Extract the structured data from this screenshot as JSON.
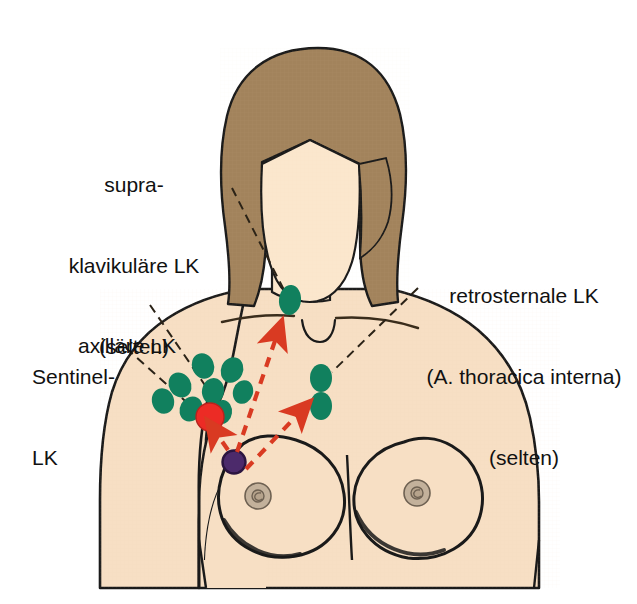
{
  "figure": {
    "background_color": "#ffffff"
  },
  "palette": {
    "skin": "#f7dfc4",
    "skin_face": "#fbe7cd",
    "hair": "#a2835c",
    "outline": "#1a1a1a",
    "lymph_node_green": "#11805e",
    "sentinel_node_red": "#ec2b25",
    "tumor_purple": "#4c2a6b",
    "nipple": "#bfae99",
    "arrow_red": "#d93a22",
    "leader_line": "#2b2317",
    "text": "#111111"
  },
  "labels": {
    "supraclavicular": {
      "lines": [
        "supra-",
        "klavikuläre LK",
        "(selten)"
      ],
      "line1": "supra-",
      "line2": "klavikuläre LK",
      "line3": "(selten)"
    },
    "retrosternal": {
      "lines": [
        "retrosternale LK",
        "(A. thoracica interna)",
        "(selten)"
      ],
      "line1": "retrosternale LK",
      "line2": "(A. thoracica interna)",
      "line3": "(selten)"
    },
    "axillary": {
      "lines": [
        "axilläre LK"
      ],
      "line1": "axilläre LK"
    },
    "sentinel": {
      "lines": [
        "Sentinel-",
        "LK"
      ],
      "line1": "Sentinel-",
      "line2": "LK"
    }
  },
  "lymph_nodes": {
    "axillary_green": [
      {
        "cx": 203,
        "cy": 366,
        "rx": 11,
        "ry": 13,
        "rot": -22
      },
      {
        "cx": 232,
        "cy": 370,
        "rx": 11,
        "ry": 13,
        "rot": 24
      },
      {
        "cx": 180,
        "cy": 385,
        "rx": 11,
        "ry": 13,
        "rot": -30
      },
      {
        "cx": 213,
        "cy": 391,
        "rx": 11,
        "ry": 13,
        "rot": 10
      },
      {
        "cx": 243,
        "cy": 392,
        "rx": 10,
        "ry": 12,
        "rot": 18
      },
      {
        "cx": 163,
        "cy": 401,
        "rx": 11,
        "ry": 13,
        "rot": -18
      },
      {
        "cx": 191,
        "cy": 409,
        "rx": 11,
        "ry": 13,
        "rot": 30
      },
      {
        "cx": 222,
        "cy": 412,
        "rx": 10,
        "ry": 12,
        "rot": 8
      }
    ],
    "supraclavicular_green": [
      {
        "cx": 290,
        "cy": 300,
        "rx": 11,
        "ry": 15,
        "rot": 6
      }
    ],
    "retrosternal_green": [
      {
        "cx": 321,
        "cy": 378,
        "rx": 11,
        "ry": 14,
        "rot": 0
      },
      {
        "cx": 321,
        "cy": 406,
        "rx": 11,
        "ry": 14,
        "rot": 0
      }
    ],
    "sentinel_red": {
      "cx": 210,
      "cy": 417,
      "r": 14
    },
    "tumor_purple": {
      "cx": 234,
      "cy": 462,
      "r": 11
    }
  },
  "arrows": {
    "to_sentinel": {
      "from_x": 228,
      "from_y": 450,
      "to_x": 212,
      "to_y": 428
    },
    "to_supraclavicular": {
      "from_x": 236,
      "from_y": 452,
      "to_x": 277,
      "to_y": 327
    },
    "to_retrosternal": {
      "from_x": 246,
      "from_y": 468,
      "to_x": 303,
      "to_y": 408
    }
  },
  "leader_lines": {
    "supraclavicular": {
      "x1": 232,
      "y1": 188,
      "x2": 284,
      "y2": 290
    },
    "retrosternal": {
      "x1": 418,
      "y1": 288,
      "x2": 332,
      "y2": 372
    },
    "axillary": {
      "x1": 150,
      "y1": 305,
      "x2": 209,
      "y2": 390
    },
    "sentinel": {
      "x1": 128,
      "y1": 348,
      "x2": 200,
      "y2": 415
    }
  },
  "body_parts": {
    "hair": "hair",
    "face": "face",
    "torso": "torso",
    "left_breast": "left-breast",
    "right_breast": "right-breast",
    "left_nipple": "left-nipple",
    "right_nipple": "right-nipple",
    "clavicle_left": "clavicle-left",
    "clavicle_right": "clavicle-right",
    "suprasternal_notch": "suprasternal-notch"
  }
}
